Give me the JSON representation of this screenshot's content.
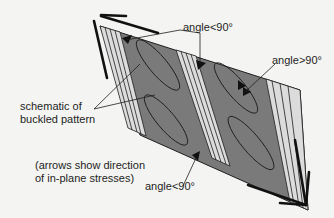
{
  "diagram": {
    "type": "schematic of buckled pattern under in-plane shear stresses",
    "colors": {
      "background": "#f4f4f2",
      "panel_fill": "#7a7a7a",
      "band_fill": "#dcdcdc",
      "outline": "#1e1e1e"
    },
    "labels": {
      "angle_top": "angle<90°",
      "angle_right": "angle>90°",
      "angle_bottom": "angle<90°",
      "schematic_line1": "schematic of",
      "schematic_line2": "buckled pattern",
      "arrows_line1": "(arrows show direction",
      "arrows_line2": "of in-plane stresses)"
    },
    "stress_arrows": [
      {
        "position": "top-left",
        "direction": "outward (up-left)"
      },
      {
        "position": "bottom-right",
        "direction": "outward (down-right)"
      }
    ],
    "bands": 3,
    "ellipses": 4
  }
}
